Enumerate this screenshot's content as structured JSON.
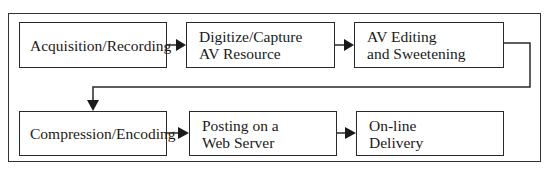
{
  "diagram": {
    "row1": [
      {
        "id": "acquisition",
        "label": "Acquisition/Recording"
      },
      {
        "id": "digitize",
        "label": "Digitize/Capture\nAV Resource"
      },
      {
        "id": "editing",
        "label": "AV Editing\nand Sweetening"
      }
    ],
    "row2": [
      {
        "id": "compression",
        "label": "Compression/Encoding"
      },
      {
        "id": "posting",
        "label": "Posting on a\nWeb Server"
      },
      {
        "id": "delivery",
        "label": "On-line\nDelivery"
      }
    ],
    "edges": [
      [
        "acquisition",
        "digitize"
      ],
      [
        "digitize",
        "editing"
      ],
      [
        "editing",
        "compression"
      ],
      [
        "compression",
        "posting"
      ],
      [
        "posting",
        "delivery"
      ]
    ],
    "colors": {
      "stroke": "#2a2a2a",
      "background": "#ffffff",
      "text": "#1a1a1a"
    }
  }
}
